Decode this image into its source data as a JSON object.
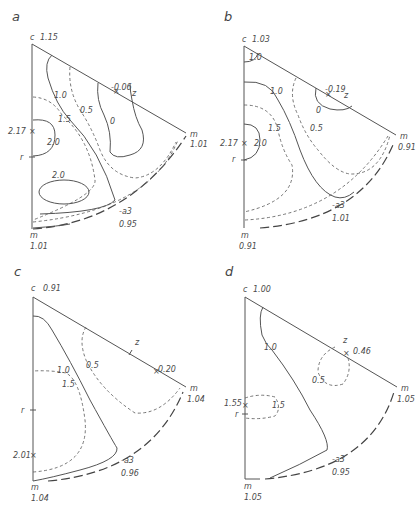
{
  "figure": {
    "panels": [
      {
        "id": "a",
        "label": "a",
        "apex": {
          "name": "c",
          "value": "1.15"
        },
        "corner_right": {
          "name": "m",
          "value": "1.01"
        },
        "corner_bottom": {
          "name": "m",
          "value": "1.01"
        },
        "extremum_left": {
          "value": "2.17",
          "marker": "x"
        },
        "axis_point_r": "r",
        "edge_point_z": {
          "name": "z",
          "value": "-0.06",
          "marker": "x"
        },
        "arc_label": {
          "name": "-a3",
          "value": "0.95"
        },
        "contours": [
          "1.0",
          "0.5",
          "0",
          "1.5",
          "2.0",
          "2.0"
        ]
      },
      {
        "id": "b",
        "label": "b",
        "apex": {
          "name": "c",
          "value": "1.03"
        },
        "corner_right": {
          "name": "m",
          "value": "0.91"
        },
        "corner_bottom": {
          "name": "m",
          "value": "0.91"
        },
        "extremum_left": {
          "value": "2.17",
          "marker": "x"
        },
        "axis_point_r": "r",
        "edge_point_z": {
          "name": "z",
          "value": "-0.19",
          "marker": "x"
        },
        "arc_label": {
          "name": "-a3",
          "value": "1.01"
        },
        "contours": [
          "1.0",
          "1.0",
          "0",
          "1.5",
          "0.5",
          "2.0"
        ]
      },
      {
        "id": "c",
        "label": "c",
        "apex": {
          "name": "c",
          "value": "0.91"
        },
        "corner_right": {
          "name": "m",
          "value": "1.04"
        },
        "corner_bottom": {
          "name": "m",
          "value": "1.04"
        },
        "extremum_left": {
          "value": "2.01",
          "marker": "x"
        },
        "axis_point_r": "r",
        "edge_point_z": {
          "name": "z",
          "value": "0.20",
          "marker": "x"
        },
        "arc_label": {
          "name": "-a3",
          "value": "0.96"
        },
        "contours": [
          "1.0",
          "0.5",
          "1.5"
        ]
      },
      {
        "id": "d",
        "label": "d",
        "apex": {
          "name": "c",
          "value": "1.00"
        },
        "corner_right": {
          "name": "m",
          "value": "1.05"
        },
        "corner_bottom": {
          "name": "m",
          "value": "1.05"
        },
        "extremum_left": {
          "value": "1.55",
          "marker": "x"
        },
        "axis_point_r": "r",
        "edge_point_z": {
          "name": "z",
          "value": "0.46",
          "marker": "x"
        },
        "arc_label": {
          "name": "-a3",
          "value": "0.95"
        },
        "contours": [
          "1.0",
          "0.5",
          "1.5"
        ]
      }
    ],
    "legend_line_styles": {
      "solid": "contour (integer/half levels)",
      "dashed": "contour (intermediate levels)",
      "long_dashed": "outer boundary arc"
    }
  }
}
